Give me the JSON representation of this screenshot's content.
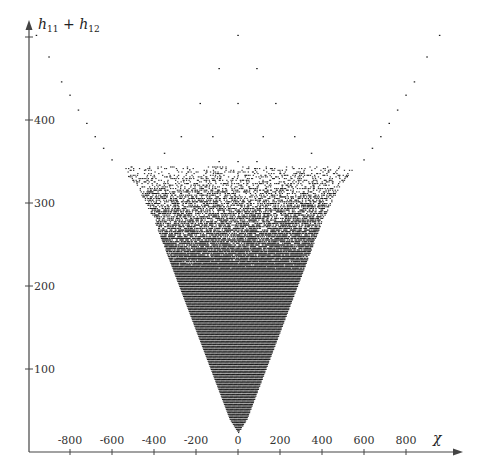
{
  "chart_data": {
    "type": "scatter",
    "title": "",
    "xlabel": "χ",
    "ylabel": "h11 + h12",
    "ylabel_parts": {
      "base1": "h",
      "sub1": "11",
      "op": " + ",
      "base2": "h",
      "sub2": "12"
    },
    "xlim": [
      -1000,
      1060
    ],
    "ylim": [
      0,
      520
    ],
    "x_ticks": [
      -800,
      -600,
      -400,
      -200,
      0,
      200,
      400,
      600,
      800
    ],
    "x_tick_labels": [
      "-800",
      "-600",
      "-400",
      "-200",
      "0",
      "200",
      "400",
      "600",
      "800"
    ],
    "y_ticks": [
      100,
      200,
      300,
      400,
      500
    ],
    "y_tick_labels": [
      "100",
      "200",
      "300",
      "400",
      ""
    ],
    "grid": false,
    "legend": "none",
    "marker_color": "#1a1a1a",
    "symmetric_about_x0": true,
    "dense_region": {
      "description": "filled V-shaped region of Hodge pairs",
      "apex": [
        0,
        24
      ],
      "boundary_points": [
        [
          -40,
          40
        ],
        [
          -100,
          80
        ],
        [
          -160,
          120
        ],
        [
          -220,
          160
        ],
        [
          -280,
          200
        ],
        [
          -340,
          240
        ],
        [
          -400,
          280
        ],
        [
          -480,
          320
        ],
        [
          -540,
          340
        ]
      ],
      "dense_below_h": 220
    },
    "sparse_points": [
      [
        0,
        502
      ],
      [
        -960,
        502
      ],
      [
        960,
        502
      ],
      [
        -900,
        476
      ],
      [
        900,
        476
      ],
      [
        -840,
        446
      ],
      [
        840,
        446
      ],
      [
        -800,
        430
      ],
      [
        800,
        430
      ],
      [
        -760,
        412
      ],
      [
        760,
        412
      ],
      [
        -720,
        396
      ],
      [
        720,
        396
      ],
      [
        -680,
        380
      ],
      [
        680,
        380
      ],
      [
        -640,
        366
      ],
      [
        640,
        366
      ],
      [
        -600,
        352
      ],
      [
        600,
        352
      ],
      [
        -90,
        462
      ],
      [
        90,
        462
      ],
      [
        -180,
        420
      ],
      [
        0,
        420
      ],
      [
        180,
        420
      ],
      [
        -270,
        380
      ],
      [
        270,
        380
      ],
      [
        -120,
        380
      ],
      [
        120,
        380
      ],
      [
        -90,
        350
      ],
      [
        90,
        350
      ],
      [
        0,
        350
      ],
      [
        -230,
        340
      ],
      [
        230,
        340
      ],
      [
        -300,
        300
      ],
      [
        300,
        300
      ],
      [
        -390,
        300
      ],
      [
        390,
        300
      ],
      [
        -520,
        332
      ],
      [
        520,
        332
      ],
      [
        -440,
        340
      ],
      [
        440,
        340
      ],
      [
        -350,
        360
      ],
      [
        350,
        360
      ]
    ]
  }
}
